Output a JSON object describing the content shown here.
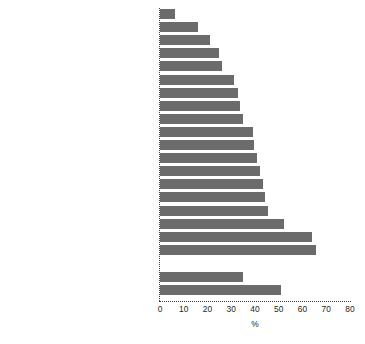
{
  "chart_data": {
    "type": "bar",
    "orientation": "horizontal",
    "title": "",
    "xlabel": "%",
    "ylabel": "",
    "xlim": [
      0,
      80
    ],
    "xticks": [
      0,
      10,
      20,
      30,
      40,
      50,
      60,
      70,
      80
    ],
    "grid": false,
    "legend": null,
    "bar_color": "#6b6b6b",
    "categories": [
      "Engineering",
      "IT",
      "CEOs",
      "Architecture",
      "Chiefs of fire, ambulance, and police",
      "Film & TV",
      "Corporate senior management",
      "Finance",
      "Management consulting",
      "Accountancy",
      "Science",
      "Academia",
      "Advertising",
      "Performing arts",
      "Law",
      "Medicine",
      "Journalism",
      "Life sciences",
      "Public-sector senior management",
      "Top jobs overall",
      "In whole workforce"
    ],
    "values": [
      6.5,
      16,
      21,
      25,
      26,
      31,
      33,
      33.5,
      35,
      39,
      39.5,
      41,
      42,
      43.5,
      44,
      45.5,
      52,
      64,
      65.5,
      35,
      51
    ],
    "group_gap_after_index": 18
  }
}
